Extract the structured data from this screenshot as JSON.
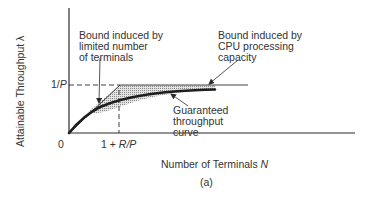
{
  "figure": {
    "caption": "(a)",
    "x_axis": {
      "label_text": "Number of Terminals ",
      "label_var": "N",
      "origin_label": "0",
      "tick_label_prefix": "1 + ",
      "tick_label_var": "R/P"
    },
    "y_axis": {
      "label": "Attainable Throughput λ",
      "tick_label_prefix": "1/",
      "tick_label_var": "P"
    },
    "annotations": {
      "terminal_bound": "Bound induced by\nlimited number\nof terminals",
      "cpu_bound": "Bound induced by\nCPU processing\ncapacity",
      "guaranteed_curve": "Guaranteed\nthroughput\ncurve"
    },
    "colors": {
      "line": "#2a2a2a",
      "shading": "#bdbdbd"
    }
  }
}
